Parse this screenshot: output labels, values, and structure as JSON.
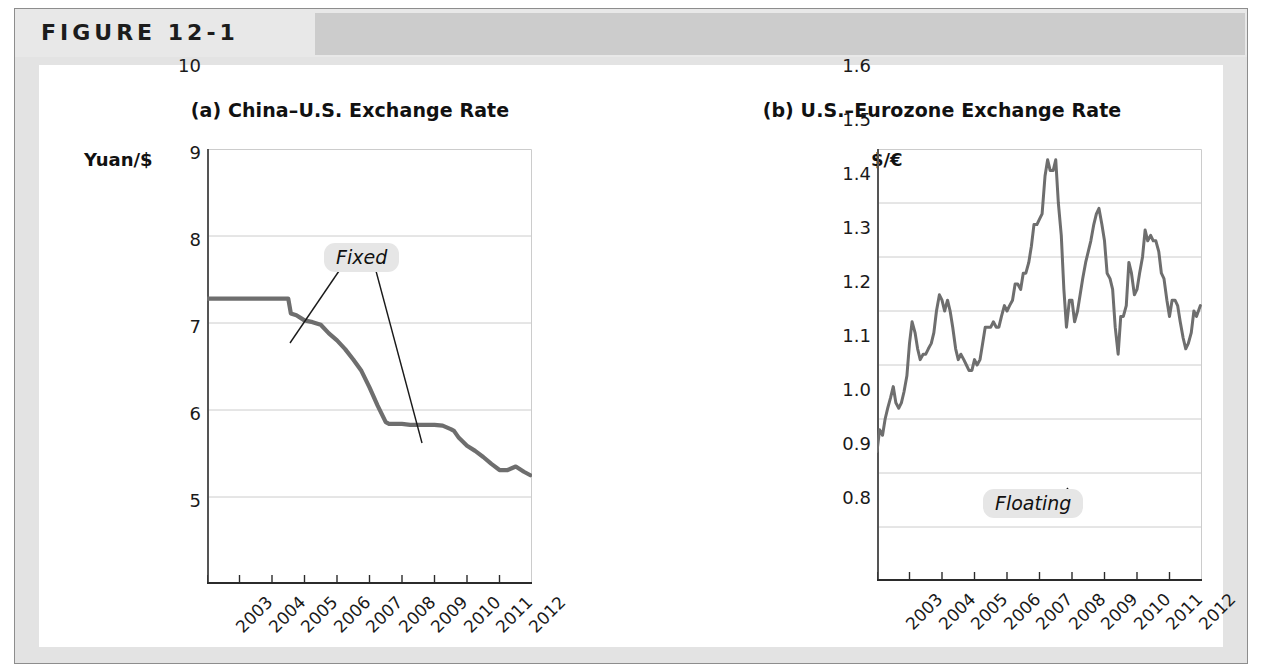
{
  "figure": {
    "label": "FIGURE 12-1",
    "frame_color": "#e3e3e3",
    "header_band_color": "#cccccc",
    "panel_color": "#ffffff"
  },
  "series_color": "#6e6e6e",
  "gridline_color": "#cccccc",
  "axis_color": "#555555",
  "chart_data": [
    {
      "type": "line",
      "id": "china-us",
      "title": "(a) China–U.S. Exchange Rate",
      "ylabel": "Yuan/$",
      "xlabel": "",
      "ylim": [
        5,
        10
      ],
      "yticks": [
        "10",
        "9",
        "8",
        "7",
        "6",
        "5"
      ],
      "ytickvals": [
        10,
        9,
        8,
        7,
        6,
        5
      ],
      "xlim": [
        2003,
        2013
      ],
      "xticks": [
        "2003",
        "2004",
        "2005",
        "2006",
        "2007",
        "2008",
        "2009",
        "2010",
        "2011",
        "2012"
      ],
      "xtickvals": [
        2003,
        2004,
        2005,
        2006,
        2007,
        2008,
        2009,
        2010,
        2011,
        2012
      ],
      "grid": true,
      "legend": "none",
      "annotations": [
        {
          "text": "Fixed",
          "style": "italic-chip"
        }
      ],
      "x": [
        2003.0,
        2003.25,
        2003.5,
        2003.75,
        2004.0,
        2004.25,
        2004.5,
        2004.75,
        2005.0,
        2005.25,
        2005.5,
        2005.58,
        2005.75,
        2006.0,
        2006.25,
        2006.5,
        2006.75,
        2007.0,
        2007.25,
        2007.5,
        2007.75,
        2008.0,
        2008.25,
        2008.5,
        2008.6,
        2008.75,
        2009.0,
        2009.25,
        2009.5,
        2009.75,
        2010.0,
        2010.25,
        2010.5,
        2010.6,
        2010.75,
        2011.0,
        2011.25,
        2011.5,
        2011.75,
        2012.0,
        2012.25,
        2012.5,
        2012.75,
        2012.95
      ],
      "y": [
        8.28,
        8.28,
        8.28,
        8.28,
        8.28,
        8.28,
        8.28,
        8.28,
        8.28,
        8.28,
        8.28,
        8.11,
        8.09,
        8.03,
        8.01,
        7.98,
        7.88,
        7.8,
        7.7,
        7.58,
        7.45,
        7.26,
        7.05,
        6.86,
        6.84,
        6.84,
        6.84,
        6.83,
        6.83,
        6.83,
        6.83,
        6.82,
        6.78,
        6.76,
        6.68,
        6.59,
        6.53,
        6.46,
        6.38,
        6.31,
        6.31,
        6.35,
        6.29,
        6.25
      ]
    },
    {
      "type": "line",
      "id": "us-eurozone",
      "title": "(b) U.S.–Eurozone Exchange Rate",
      "ylabel": "$/€",
      "xlabel": "",
      "ylim": [
        0.8,
        1.6
      ],
      "yticks": [
        "1.6",
        "1.5",
        "1.4",
        "1.3",
        "1.2",
        "1.1",
        "1.0",
        "0.9",
        "0.8"
      ],
      "ytickvals": [
        1.6,
        1.5,
        1.4,
        1.3,
        1.2,
        1.1,
        1.0,
        0.9,
        0.8
      ],
      "xlim": [
        2003,
        2013
      ],
      "xticks": [
        "2003",
        "2004",
        "2005",
        "2006",
        "2007",
        "2008",
        "2009",
        "2010",
        "2011",
        "2012"
      ],
      "xtickvals": [
        2003,
        2004,
        2005,
        2006,
        2007,
        2008,
        2009,
        2010,
        2011,
        2012
      ],
      "grid": true,
      "legend": "none",
      "annotations": [
        {
          "text": "Floating",
          "style": "italic-chip"
        }
      ],
      "x": [
        2003.0,
        2003.08,
        2003.17,
        2003.25,
        2003.33,
        2003.42,
        2003.5,
        2003.58,
        2003.67,
        2003.75,
        2003.83,
        2003.92,
        2004.0,
        2004.08,
        2004.17,
        2004.25,
        2004.33,
        2004.42,
        2004.5,
        2004.58,
        2004.67,
        2004.75,
        2004.83,
        2004.92,
        2005.0,
        2005.08,
        2005.17,
        2005.25,
        2005.33,
        2005.42,
        2005.5,
        2005.58,
        2005.67,
        2005.75,
        2005.83,
        2005.92,
        2006.0,
        2006.08,
        2006.17,
        2006.25,
        2006.33,
        2006.42,
        2006.5,
        2006.58,
        2006.67,
        2006.75,
        2006.83,
        2006.92,
        2007.0,
        2007.08,
        2007.17,
        2007.25,
        2007.33,
        2007.42,
        2007.5,
        2007.58,
        2007.67,
        2007.75,
        2007.83,
        2007.92,
        2008.0,
        2008.08,
        2008.17,
        2008.25,
        2008.33,
        2008.42,
        2008.5,
        2008.58,
        2008.67,
        2008.75,
        2008.83,
        2008.92,
        2009.0,
        2009.08,
        2009.17,
        2009.25,
        2009.33,
        2009.42,
        2009.5,
        2009.58,
        2009.67,
        2009.75,
        2009.83,
        2009.92,
        2010.0,
        2010.08,
        2010.17,
        2010.25,
        2010.33,
        2010.42,
        2010.5,
        2010.58,
        2010.67,
        2010.75,
        2010.83,
        2010.92,
        2011.0,
        2011.08,
        2011.17,
        2011.25,
        2011.33,
        2011.42,
        2011.5,
        2011.58,
        2011.67,
        2011.75,
        2011.83,
        2011.92,
        2012.0,
        2012.08,
        2012.17,
        2012.25,
        2012.33,
        2012.42,
        2012.5,
        2012.58,
        2012.67,
        2012.75,
        2012.83,
        2012.95
      ],
      "y": [
        1.04,
        1.08,
        1.07,
        1.1,
        1.12,
        1.14,
        1.16,
        1.13,
        1.12,
        1.13,
        1.15,
        1.18,
        1.24,
        1.28,
        1.26,
        1.23,
        1.21,
        1.22,
        1.22,
        1.23,
        1.24,
        1.26,
        1.3,
        1.33,
        1.32,
        1.3,
        1.32,
        1.3,
        1.27,
        1.23,
        1.21,
        1.22,
        1.21,
        1.2,
        1.19,
        1.19,
        1.21,
        1.2,
        1.21,
        1.24,
        1.27,
        1.27,
        1.27,
        1.28,
        1.27,
        1.27,
        1.29,
        1.31,
        1.3,
        1.31,
        1.32,
        1.35,
        1.35,
        1.34,
        1.37,
        1.37,
        1.39,
        1.42,
        1.46,
        1.46,
        1.47,
        1.48,
        1.55,
        1.58,
        1.56,
        1.56,
        1.58,
        1.5,
        1.44,
        1.34,
        1.27,
        1.32,
        1.32,
        1.28,
        1.3,
        1.33,
        1.36,
        1.39,
        1.41,
        1.43,
        1.46,
        1.48,
        1.49,
        1.46,
        1.43,
        1.37,
        1.36,
        1.34,
        1.27,
        1.22,
        1.29,
        1.29,
        1.31,
        1.39,
        1.37,
        1.33,
        1.34,
        1.37,
        1.4,
        1.45,
        1.43,
        1.44,
        1.43,
        1.43,
        1.41,
        1.37,
        1.36,
        1.32,
        1.29,
        1.32,
        1.32,
        1.31,
        1.28,
        1.25,
        1.23,
        1.24,
        1.26,
        1.3,
        1.29,
        1.31
      ]
    }
  ]
}
